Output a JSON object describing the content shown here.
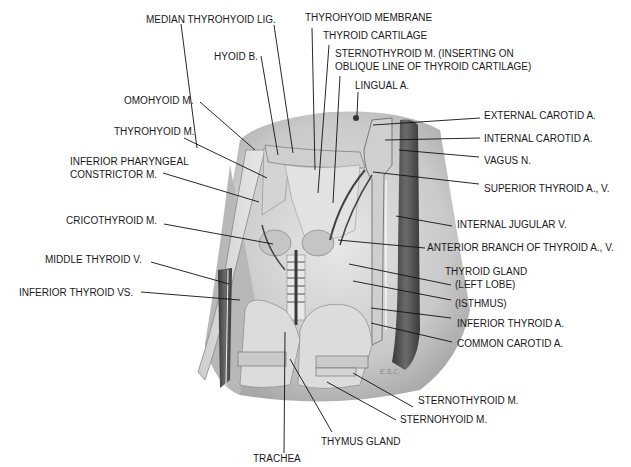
{
  "figure": {
    "signature": "E.S.C.",
    "colors": {
      "background": "#ffffff",
      "skin_shadow": "#bdbdbd",
      "tissue_light": "#d9d9d9",
      "vessel_dark": "#4a4a4a",
      "label_text": "#1a1a1a"
    }
  },
  "labels": {
    "median_thyrohyoid_lig": "MEDIAN THYROHYOID LIG.",
    "thyrohyoid_membrane": "THYROHYOID MEMBRANE",
    "thyroid_cartilage": "THYROID CARTILAGE",
    "sternothyroid_inserting_1": "STERNOTHYROID M. (INSERTING ON",
    "sternothyroid_inserting_2": "OBLIQUE LINE OF THYROID CARTILAGE)",
    "hyoid_b": "HYOID B.",
    "lingual_a": "LINGUAL A.",
    "omohyoid_m": "OMOHYOID M.",
    "thyrohyoid_m": "THYROHYOID M.",
    "inferior_pharyngeal_1": "INFERIOR PHARYNGEAL",
    "inferior_pharyngeal_2": "CONSTRICTOR M.",
    "cricothyroid_m": "CRICOTHYROID M.",
    "middle_thyroid_v": "MIDDLE THYROID V.",
    "inferior_thyroid_vs": "INFERIOR THYROID VS.",
    "external_carotid_a": "EXTERNAL CAROTID A.",
    "internal_carotid_a": "INTERNAL CAROTID A.",
    "vagus_n": "VAGUS N.",
    "superior_thyroid_av": "SUPERIOR THYROID A., V.",
    "internal_jugular_v": "INTERNAL JUGULAR V.",
    "anterior_branch": "ANTERIOR BRANCH OF THYROID A., V.",
    "thyroid_gland_1": "THYROID GLAND",
    "thyroid_gland_2": "(LEFT LOBE)",
    "isthmus": "(ISTHMUS)",
    "inferior_thyroid_a": "INFERIOR THYROID A.",
    "common_carotid_a": "COMMON CAROTID A.",
    "sternothyroid_m": "STERNOTHYROID M.",
    "sternohyoid_m": "STERNOHYOID M.",
    "thymus_gland": "THYMUS GLAND",
    "trachea": "TRACHEA"
  }
}
